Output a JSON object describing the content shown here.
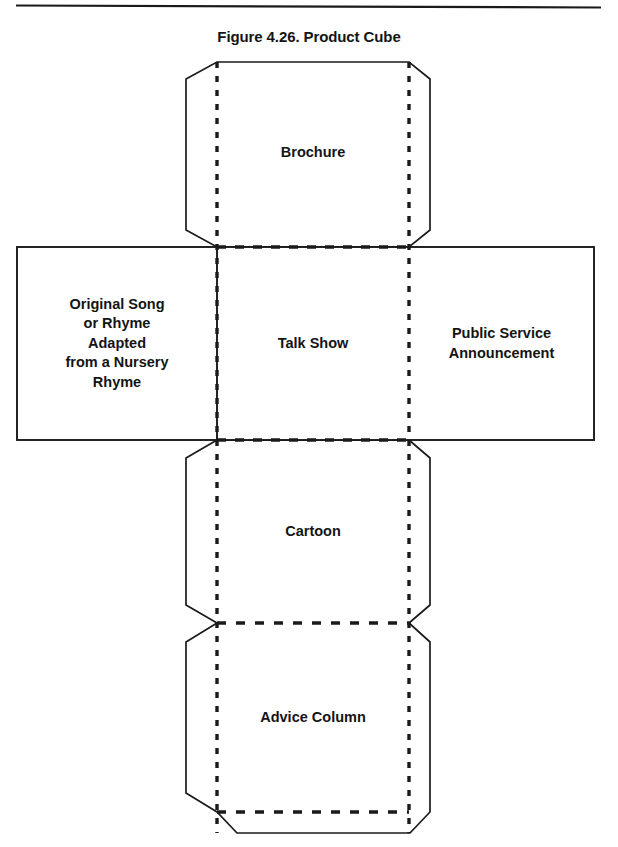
{
  "figure": {
    "title": "Figure 4.26. Product Cube",
    "type": "cube-net-template",
    "page_rule": "horizontal-rule-top"
  },
  "colors": {
    "ink": "#141414",
    "line": "#1a1a1a",
    "background": "#ffffff"
  },
  "panels": {
    "brochure": {
      "label": "Brochure",
      "position": "top",
      "edges": "tabs-on-left-and-right-corners"
    },
    "original_song": {
      "label": "Original Song\nor Rhyme\nAdapted\nfrom a Nursery\nRhyme",
      "position": "left",
      "edges": "solid-rectangle"
    },
    "talk_show": {
      "label": "Talk Show",
      "position": "center",
      "edges": "all-dashed-fold-lines"
    },
    "public_service": {
      "label": "Public Service\nAnnouncement",
      "position": "right",
      "edges": "solid-rectangle"
    },
    "cartoon": {
      "label": "Cartoon",
      "position": "below-center",
      "edges": "side-glue-tabs"
    },
    "advice_column": {
      "label": "Advice Column",
      "position": "bottom",
      "edges": "side-and-bottom-glue-tabs"
    }
  },
  "geometry": {
    "fold_line_style": "dashed",
    "cut_line_style": "solid",
    "left_fold_x": 217,
    "right_fold_x": 409,
    "row_tops": [
      62,
      247,
      440,
      623
    ],
    "row_bottom": 812
  }
}
